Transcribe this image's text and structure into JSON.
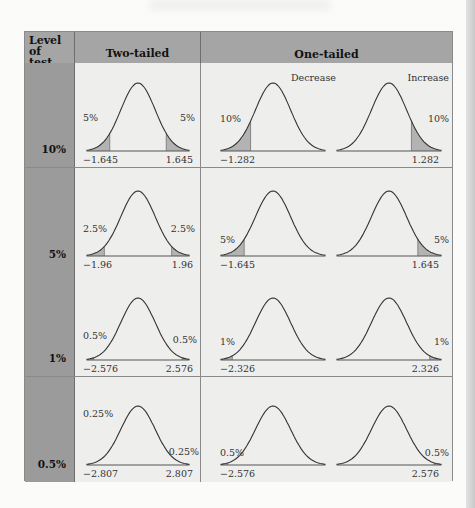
{
  "table": {
    "headers": {
      "level": "Level of test",
      "level_line1": "Level of",
      "level_line2": "test",
      "two_tailed": "Two-tailed",
      "one_tailed": "One-tailed"
    },
    "one_tailed_labels": {
      "decrease": "Decrease",
      "increase": "Increase"
    },
    "rows": [
      {
        "level": "10%",
        "two_tail_pct": "5%",
        "two_neg": "−1.645",
        "two_pos": "1.645",
        "one_pct": "10%",
        "one_neg": "−1.282",
        "one_pos": "1.282"
      },
      {
        "level": "5%",
        "two_tail_pct": "2.5%",
        "two_neg": "−1.96",
        "two_pos": "1.96",
        "one_pct": "5%",
        "one_neg": "−1.645",
        "one_pos": "1.645"
      },
      {
        "level": "1%",
        "two_tail_pct": "0.5%",
        "two_neg": "−2.576",
        "two_pos": "2.576",
        "one_pct": "1%",
        "one_neg": "−2.326",
        "one_pos": "2.326"
      },
      {
        "level": "0.5%",
        "two_tail_pct": "0.25%",
        "two_neg": "−2.807",
        "two_pos": "2.807",
        "one_pct": "0.5%",
        "one_neg": "−2.576",
        "one_pos": "2.576"
      }
    ]
  },
  "colors": {
    "header_bg": "#a5a5a5",
    "level_col_bg": "#9b9b9b",
    "cell_bg": "#eeeeed",
    "shade": "#b3b3b3",
    "curve": "#333333"
  }
}
